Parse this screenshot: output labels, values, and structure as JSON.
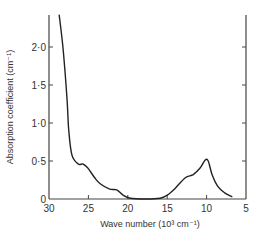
{
  "chart_data": {
    "type": "line",
    "title": "",
    "xlabel": "Wave number (10³ cm⁻¹)",
    "ylabel": "Absorption coefficient (cm⁻¹)",
    "xlim": [
      30,
      5
    ],
    "ylim": [
      0,
      2.4
    ],
    "x_reversed": true,
    "grid": false,
    "legend": null,
    "xticks": [
      "30",
      "25",
      "20",
      "15",
      "10",
      "5"
    ],
    "yticks": [
      "0",
      "0·5",
      "1·0",
      "1·5",
      "2·0"
    ],
    "series": [
      {
        "name": "absorption",
        "x": [
          28.7,
          28.2,
          27.7,
          27.5,
          27.1,
          26.3,
          25.7,
          25.1,
          24.2,
          23.5,
          22.3,
          21.4,
          20.6,
          19.7,
          17.8,
          15.9,
          15.0,
          14.0,
          12.7,
          11.7,
          10.8,
          10.2,
          9.8,
          9.3,
          8.6,
          7.7,
          6.8
        ],
        "y": [
          2.42,
          1.96,
          1.3,
          0.91,
          0.58,
          0.46,
          0.46,
          0.41,
          0.28,
          0.2,
          0.13,
          0.12,
          0.05,
          0.01,
          0.0,
          0.01,
          0.05,
          0.14,
          0.28,
          0.32,
          0.41,
          0.51,
          0.5,
          0.32,
          0.17,
          0.08,
          0.03
        ]
      }
    ]
  },
  "axes": {
    "x_label_main": "Wave number",
    "x_label_unit": "(10³ cm⁻¹)",
    "y_label": "Absorption coefficient (cm⁻¹)"
  }
}
